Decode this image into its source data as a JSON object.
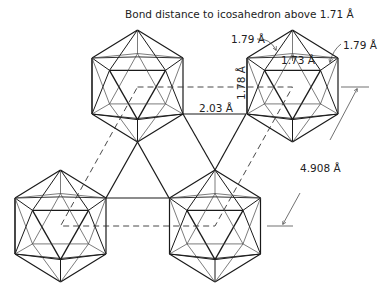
{
  "figure": {
    "title": "Bond distance to icosahedron above 1.71 Å",
    "labels": {
      "bond_179_left": "1.79 Å",
      "bond_179_right": "1.79 Å",
      "bond_173": "1.73 Å",
      "bond_203": "2.03 Å",
      "bond_178": "1.78 Å",
      "lattice_4908": "4.908 Å"
    },
    "colors": {
      "line": "#1a1a1a",
      "thin_line": "#333333",
      "background": "#ffffff"
    },
    "icosahedra": [
      {
        "name": "upper-left",
        "cx": 137.5,
        "top": 30,
        "bottom": 142
      },
      {
        "name": "upper-right",
        "cx": 292.5,
        "top": 30,
        "bottom": 142
      },
      {
        "name": "lower-left",
        "cx": 60.5,
        "top": 170,
        "bottom": 282
      },
      {
        "name": "lower-right",
        "cx": 215,
        "top": 170,
        "bottom": 282
      }
    ]
  }
}
